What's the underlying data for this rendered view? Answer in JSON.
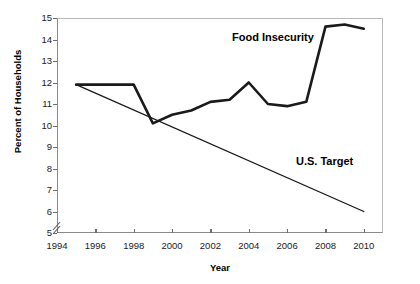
{
  "chart_data": {
    "type": "line",
    "title": "",
    "xlabel": "Year",
    "ylabel": "Percent of Households",
    "xlim": [
      1994,
      2011
    ],
    "ylim": [
      5,
      15
    ],
    "grid": false,
    "legend_position": "inline-annotations",
    "axis_break": true,
    "xticks": [
      1994,
      1996,
      1998,
      2000,
      2002,
      2004,
      2006,
      2008,
      2010
    ],
    "xtick_labels": [
      "1994",
      "1996",
      "1998",
      "2000",
      "2002",
      "2004",
      "2006",
      "2008",
      "2010"
    ],
    "yticks": [
      5,
      6,
      7,
      8,
      9,
      10,
      11,
      12,
      13,
      14,
      15
    ],
    "ytick_labels": [
      "5",
      "6",
      "7",
      "8",
      "9",
      "10",
      "11",
      "12",
      "13",
      "14",
      "15"
    ],
    "series": [
      {
        "name": "Food Insecurity",
        "color": "#1a1a1a",
        "x": [
          1995,
          1998,
          1999,
          2000,
          2001,
          2002,
          2003,
          2004,
          2005,
          2006,
          2007,
          2008,
          2009,
          2010
        ],
        "values": [
          11.9,
          11.9,
          10.1,
          10.5,
          10.7,
          11.1,
          11.2,
          12.0,
          11.0,
          10.9,
          11.1,
          14.6,
          14.7,
          14.5
        ]
      },
      {
        "name": "U.S. Target",
        "color": "#1a1a1a",
        "x": [
          1995,
          2010
        ],
        "values": [
          11.9,
          6.0
        ]
      }
    ],
    "annotations": [
      {
        "text": "Food Insecurity",
        "x": 2006,
        "y": 14.4
      },
      {
        "text": "U.S. Target",
        "x": 2007.5,
        "y": 8.4
      }
    ]
  }
}
